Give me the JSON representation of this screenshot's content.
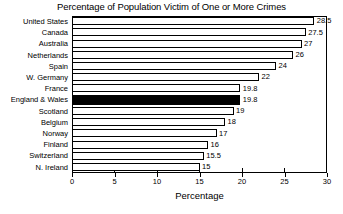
{
  "chart_data": {
    "type": "bar",
    "orientation": "horizontal",
    "title": "Percentage of Population Victim of One or More Crimes",
    "xlabel": "Percentage",
    "ylabel": "",
    "xlim": [
      0,
      30
    ],
    "xticks": [
      0,
      5,
      10,
      15,
      20,
      25,
      30
    ],
    "grid": false,
    "legend": false,
    "categories": [
      "United States",
      "Canada",
      "Australia",
      "Netherlands",
      "Spain",
      "W. Germany",
      "France",
      "England & Wales",
      "Scotland",
      "Belgium",
      "Norway",
      "Finland",
      "Switzerland",
      "N. Ireland"
    ],
    "values": [
      28.5,
      27.5,
      27,
      26,
      24,
      22,
      19.8,
      19.8,
      19,
      18,
      17,
      16,
      15.5,
      15
    ],
    "value_labels": [
      "28.5",
      "27.5",
      "27",
      "26",
      "24",
      "22",
      "19.8",
      "19.8",
      "19",
      "18",
      "17",
      "16",
      "15.5",
      "15"
    ],
    "highlighted_category": "England & Wales",
    "colors": {
      "bar_fill": "#ffffff",
      "bar_edge": "#000000",
      "highlight_fill": "#000000",
      "background": "#ffffff",
      "text": "#000000"
    }
  }
}
